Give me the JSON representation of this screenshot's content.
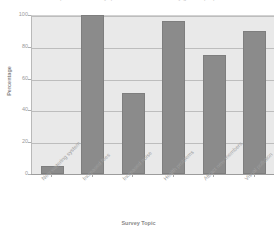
{
  "chart_data": {
    "type": "bar",
    "title": "Responses to survey question about community garden proposal",
    "xlabel": "Survey Topic",
    "ylabel": "Percentage",
    "categories": [
      "New watering system",
      "Increased fees",
      "Increased noise",
      "Health problems",
      "Attract new members",
      "Visual pollution"
    ],
    "values": [
      5,
      100,
      51,
      96,
      75,
      90
    ],
    "ylim": [
      0,
      100
    ],
    "yticks": [
      0,
      20,
      40,
      60,
      80,
      100
    ],
    "ytick_labels": [
      "0",
      "20",
      "40",
      "60",
      "80",
      "100"
    ],
    "grid": true,
    "legend": "none",
    "colors": {
      "bar_fill": "#8b8b8b",
      "bar_edge": "#7e7e7e",
      "plot_background": "#e9e9e9",
      "gridline": "#bdbdbd",
      "axis": "#9d9d9d",
      "text": "#8a8a8a",
      "figure_background": "#ffffff"
    }
  }
}
